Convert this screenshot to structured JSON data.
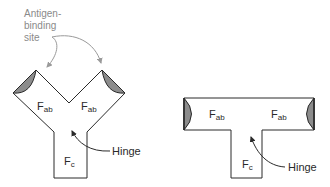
{
  "diagram": {
    "annotation": {
      "line1": "Antigen-",
      "line2": "binding",
      "line3": "site"
    },
    "y_shape": {
      "fab_left": {
        "main": "F",
        "sub": "ab"
      },
      "fab_right": {
        "main": "F",
        "sub": "ab"
      },
      "fc": {
        "main": "F",
        "sub": "c"
      },
      "hinge": "Hinge"
    },
    "t_shape": {
      "fab_left": {
        "main": "F",
        "sub": "ab"
      },
      "fab_right": {
        "main": "F",
        "sub": "ab"
      },
      "fc": {
        "main": "F",
        "sub": "c"
      },
      "hinge": "Hinge"
    },
    "colors": {
      "outline": "#2a2a2a",
      "binding_site_fill": "#8c8c8c",
      "annotation_text": "#8a8a8a",
      "annotation_arrow": "#9a9a9a"
    }
  }
}
